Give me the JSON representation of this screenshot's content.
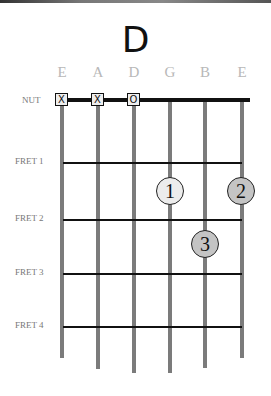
{
  "chord": {
    "name": "D"
  },
  "strings": [
    {
      "name": "E",
      "x": 62,
      "bottom": 358,
      "marker": "X"
    },
    {
      "name": "A",
      "x": 98,
      "bottom": 369,
      "marker": "X"
    },
    {
      "name": "D",
      "x": 134,
      "bottom": 373,
      "marker": "O"
    },
    {
      "name": "G",
      "x": 170,
      "bottom": 373,
      "marker": ""
    },
    {
      "name": "B",
      "x": 205,
      "bottom": 368,
      "marker": ""
    },
    {
      "name": "E",
      "x": 242,
      "bottom": 358,
      "marker": ""
    }
  ],
  "nut_label": "NUT",
  "frets": [
    {
      "label": "FRET 1",
      "y": 163
    },
    {
      "label": "FRET 2",
      "y": 220
    },
    {
      "label": "FRET 3",
      "y": 274
    },
    {
      "label": "FRET 4",
      "y": 327
    }
  ],
  "fingers": [
    {
      "number": "1",
      "string": "G",
      "fret": 2,
      "x": 170,
      "y": 191,
      "color": "#ececec"
    },
    {
      "number": "2",
      "string": "E",
      "fret": 2,
      "x": 241,
      "y": 191,
      "color": "#c4c4c4"
    },
    {
      "number": "3",
      "string": "B",
      "fret": 3,
      "x": 205,
      "y": 244,
      "color": "#c4c4c4"
    }
  ],
  "colors": {
    "string": "#7b7b7b",
    "fret": "#111111",
    "label": "#b8b8b8"
  }
}
